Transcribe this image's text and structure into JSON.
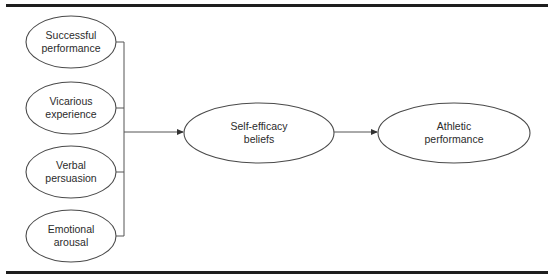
{
  "diagram": {
    "type": "path-model",
    "colors": {
      "rule": "#1e1e1e",
      "stroke": "#4a4a4a",
      "connector": "#555555",
      "text": "#2b2b2b",
      "background": "#ffffff"
    },
    "sources": [
      {
        "id": "successful-performance",
        "line1": "Successful",
        "line2": "performance"
      },
      {
        "id": "vicarious-experience",
        "line1": "Vicarious",
        "line2": "experience"
      },
      {
        "id": "verbal-persuasion",
        "line1": "Verbal",
        "line2": "persuasion"
      },
      {
        "id": "emotional-arousal",
        "line1": "Emotional",
        "line2": "arousal"
      }
    ],
    "mediator": {
      "id": "self-efficacy-beliefs",
      "line1": "Self-efficacy",
      "line2": "beliefs"
    },
    "outcome": {
      "id": "athletic-performance",
      "line1": "Athletic",
      "line2": "performance"
    },
    "edges": [
      {
        "from": "sources",
        "to": "self-efficacy-beliefs",
        "style": "arrow"
      },
      {
        "from": "self-efficacy-beliefs",
        "to": "athletic-performance",
        "style": "arrow"
      }
    ]
  }
}
